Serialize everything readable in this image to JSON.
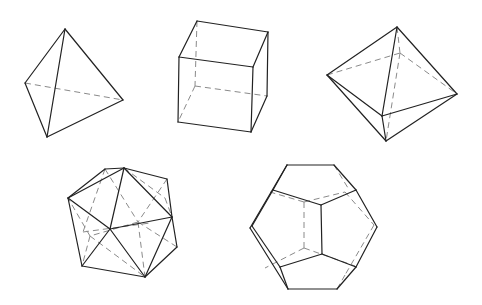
{
  "diagram": {
    "colors": {
      "visible_edge": "#222222",
      "hidden_edge": "#8a8a8a",
      "background": "#ffffff"
    },
    "solids": [
      {
        "name": "tetrahedron",
        "visible": [
          [
            65,
            29,
            25,
            83
          ],
          [
            25,
            83,
            47,
            137
          ],
          [
            47,
            137,
            123,
            100
          ],
          [
            123,
            100,
            65,
            29
          ],
          [
            65,
            29,
            47,
            137
          ]
        ],
        "hidden": [
          [
            25,
            83,
            123,
            100
          ]
        ]
      },
      {
        "name": "cube",
        "visible": [
          [
            197,
            21,
            268,
            32
          ],
          [
            197,
            21,
            179,
            57
          ],
          [
            268,
            32,
            253,
            67
          ],
          [
            179,
            57,
            253,
            67
          ],
          [
            179,
            57,
            178,
            122
          ],
          [
            253,
            67,
            251,
            132
          ],
          [
            178,
            122,
            251,
            132
          ],
          [
            268,
            32,
            267,
            96
          ],
          [
            267,
            96,
            251,
            132
          ]
        ],
        "hidden": [
          [
            197,
            21,
            195,
            86
          ],
          [
            195,
            86,
            267,
            96
          ],
          [
            195,
            86,
            178,
            122
          ]
        ]
      },
      {
        "name": "octahedron",
        "visible": [
          [
            397,
            27,
            327,
            75
          ],
          [
            397,
            27,
            457,
            94
          ],
          [
            397,
            27,
            382,
            116
          ],
          [
            327,
            75,
            382,
            116
          ],
          [
            382,
            116,
            457,
            94
          ],
          [
            327,
            75,
            386,
            141
          ],
          [
            382,
            116,
            386,
            141
          ],
          [
            457,
            94,
            386,
            141
          ]
        ],
        "hidden": [
          [
            327,
            75,
            400,
            53
          ],
          [
            400,
            53,
            457,
            94
          ],
          [
            397,
            27,
            400,
            53
          ],
          [
            400,
            53,
            386,
            141
          ]
        ]
      },
      {
        "name": "icosahedron",
        "visible": [
          [
            105,
            169,
            124,
            168
          ],
          [
            124,
            168,
            167,
            179
          ],
          [
            167,
            179,
            172,
            217
          ],
          [
            172,
            217,
            177,
            247
          ],
          [
            177,
            247,
            145,
            277
          ],
          [
            145,
            277,
            82,
            266
          ],
          [
            82,
            266,
            68,
            198
          ],
          [
            68,
            198,
            105,
            169
          ],
          [
            68,
            198,
            124,
            168
          ],
          [
            124,
            168,
            110,
            229
          ],
          [
            124,
            168,
            172,
            217
          ],
          [
            68,
            198,
            110,
            229
          ],
          [
            110,
            229,
            172,
            217
          ],
          [
            110,
            229,
            82,
            266
          ],
          [
            110,
            229,
            145,
            277
          ],
          [
            172,
            217,
            145,
            277
          ]
        ],
        "hidden": [
          [
            105,
            169,
            83,
            232
          ],
          [
            105,
            169,
            138,
            222
          ],
          [
            167,
            179,
            138,
            222
          ],
          [
            138,
            222,
            177,
            247
          ],
          [
            138,
            222,
            90,
            236
          ],
          [
            90,
            236,
            68,
            198
          ],
          [
            90,
            236,
            82,
            266
          ],
          [
            90,
            236,
            145,
            277
          ],
          [
            138,
            222,
            145,
            277
          ],
          [
            83,
            232,
            150,
            223
          ],
          [
            124,
            168,
            165,
            198
          ],
          [
            165,
            198,
            172,
            217
          ]
        ]
      },
      {
        "name": "dodecahedron",
        "visible": [
          [
            287,
            165,
            334,
            165
          ],
          [
            334,
            165,
            356,
            190
          ],
          [
            356,
            190,
            377,
            227
          ],
          [
            377,
            227,
            356,
            267
          ],
          [
            356,
            267,
            337,
            289
          ],
          [
            337,
            289,
            288,
            289
          ],
          [
            288,
            289,
            280,
            267
          ],
          [
            288,
            289,
            250,
            228
          ],
          [
            250,
            228,
            287,
            165
          ],
          [
            287,
            165,
            273,
            190
          ],
          [
            273,
            190,
            252,
            226
          ],
          [
            252,
            226,
            280,
            267
          ],
          [
            273,
            190,
            321,
            205
          ],
          [
            321,
            205,
            356,
            190
          ],
          [
            321,
            205,
            322,
            254
          ],
          [
            322,
            254,
            280,
            267
          ],
          [
            322,
            254,
            356,
            267
          ]
        ],
        "hidden": [
          [
            334,
            165,
            348,
            188
          ],
          [
            304,
            202,
            304,
            248
          ],
          [
            304,
            202,
            345,
            192
          ],
          [
            345,
            192,
            374,
            225
          ],
          [
            304,
            248,
            355,
            266
          ],
          [
            304,
            248,
            265,
            268
          ],
          [
            304,
            202,
            270,
            192
          ],
          [
            374,
            225,
            345,
            275
          ],
          [
            345,
            275,
            337,
            289
          ]
        ]
      }
    ]
  }
}
